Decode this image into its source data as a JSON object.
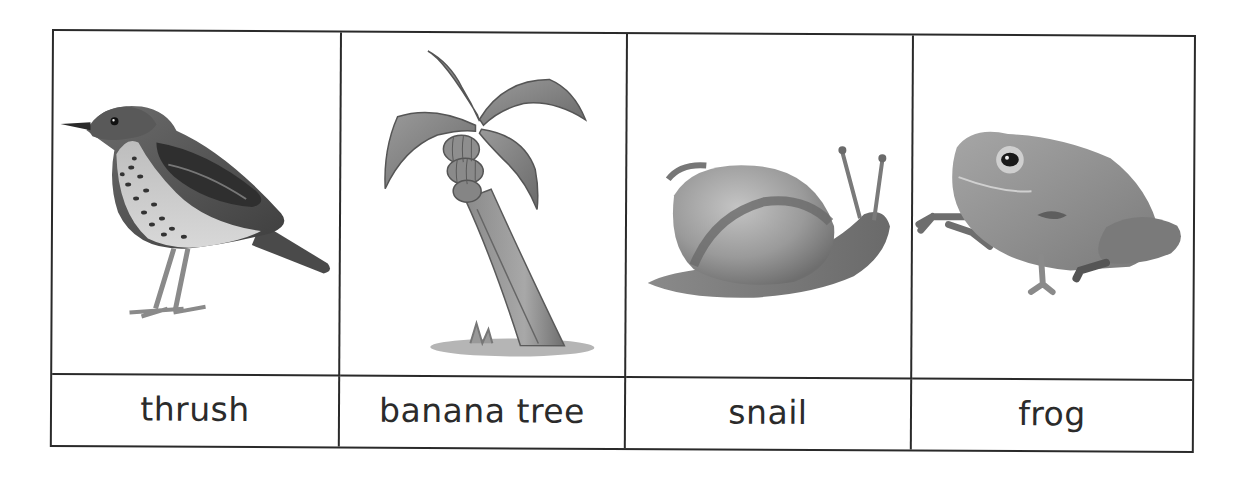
{
  "table": {
    "columns": [
      {
        "label": "thrush",
        "image": "thrush-bird-illustration"
      },
      {
        "label": "banana tree",
        "image": "banana-tree-illustration"
      },
      {
        "label": "snail",
        "image": "snail-illustration"
      },
      {
        "label": "frog",
        "image": "frog-illustration"
      }
    ]
  },
  "colors": {
    "border": "#2a2a2a",
    "text": "#2b2b2b",
    "background": "#ffffff"
  }
}
